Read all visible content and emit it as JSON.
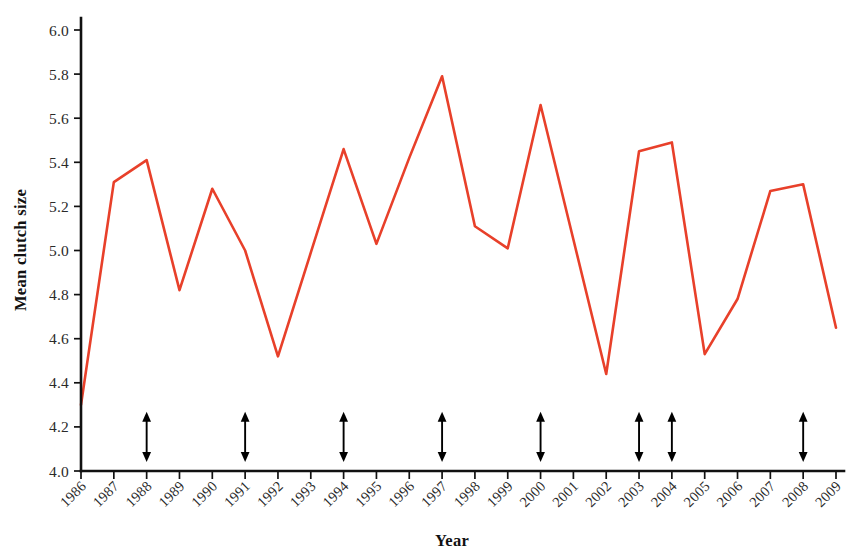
{
  "chart_data": {
    "type": "line",
    "title": "",
    "xlabel": "Year",
    "ylabel": "Mean clutch size",
    "xlim": [
      1986,
      2009
    ],
    "ylim": [
      4.0,
      6.0
    ],
    "grid": false,
    "legend": "none",
    "line_color": "#E8402A",
    "axis_color": "#111111",
    "categories": [
      "1986",
      "1987",
      "1988",
      "1989",
      "1990",
      "1991",
      "1992",
      "1993",
      "1994",
      "1995",
      "1996",
      "1997",
      "1998",
      "1999",
      "2000",
      "2001",
      "2002",
      "2003",
      "2004",
      "2005",
      "2006",
      "2007",
      "2008",
      "2009"
    ],
    "x": [
      1986,
      1987,
      1988,
      1989,
      1990,
      1991,
      1992,
      1993,
      1994,
      1995,
      1996,
      1997,
      1998,
      1999,
      2000,
      2001,
      2002,
      2003,
      2004,
      2005,
      2006,
      2007,
      2008,
      2009
    ],
    "values": [
      4.3,
      5.31,
      5.41,
      4.82,
      5.28,
      5.0,
      4.52,
      4.99,
      5.46,
      5.03,
      5.42,
      5.79,
      5.11,
      5.01,
      5.66,
      5.05,
      4.44,
      5.45,
      5.49,
      4.53,
      4.78,
      5.27,
      5.3,
      4.65
    ],
    "series": [
      {
        "name": "Mean clutch size",
        "color": "#E8402A",
        "values": [
          4.3,
          5.31,
          5.41,
          4.82,
          5.28,
          5.0,
          4.52,
          4.99,
          5.46,
          5.03,
          5.42,
          5.79,
          5.11,
          5.01,
          5.66,
          5.05,
          4.44,
          5.45,
          5.49,
          4.53,
          4.78,
          5.27,
          5.3,
          4.65
        ]
      }
    ],
    "ytick_labels": [
      "4.0",
      "4.2",
      "4.4",
      "4.6",
      "4.8",
      "5.0",
      "5.2",
      "5.4",
      "5.6",
      "5.8",
      "6.0"
    ],
    "ytick_values": [
      4.0,
      4.2,
      4.4,
      4.6,
      4.8,
      5.0,
      5.2,
      5.4,
      5.6,
      5.8,
      6.0
    ],
    "annotations": {
      "type": "double-headed-arrow",
      "description": "vertical double-headed arrows marking selected years",
      "years": [
        1988,
        1991,
        1994,
        1997,
        2000,
        2003,
        2004,
        2008
      ],
      "y_bottom": 4.05,
      "y_top": 4.26,
      "color": "#000000"
    }
  }
}
